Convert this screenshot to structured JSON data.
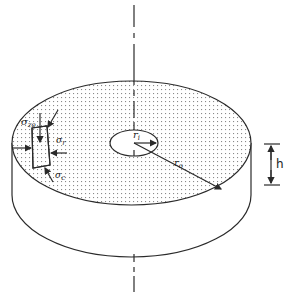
{
  "figure": {
    "colors": {
      "line": "#2a2a2a",
      "stipple": "#8a8a8a",
      "background": "#ffffff"
    }
  },
  "labels": {
    "sigma_z0": {
      "symbol": "σ",
      "sub": "zo"
    },
    "sigma_r": {
      "symbol": "σ",
      "sub": "r"
    },
    "sigma_c": {
      "symbol": "σ",
      "sub": "c"
    },
    "r_i": {
      "symbol": "r",
      "sub": "i"
    },
    "r_o": {
      "symbol": "r",
      "sub": "o"
    },
    "h": "h"
  }
}
